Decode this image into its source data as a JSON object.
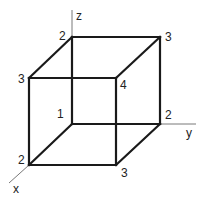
{
  "diagram": {
    "title": "",
    "type": "3D cube with vertex labels",
    "axes": {
      "x": {
        "label": "x"
      },
      "y": {
        "label": "y"
      },
      "z": {
        "label": "z"
      }
    },
    "vertices": {
      "back_bottom_left": {
        "label": "1"
      },
      "back_top_left": {
        "label": "2"
      },
      "back_top_right": {
        "label": "3"
      },
      "back_bottom_right": {
        "label": "2"
      },
      "front_top_left": {
        "label": "3"
      },
      "front_top_right": {
        "label": "4"
      },
      "front_bottom_left": {
        "label": "2"
      },
      "front_bottom_right": {
        "label": "3"
      }
    },
    "colors": {
      "edge": "#1a1a1a",
      "axis": "#555555",
      "text": "#222222",
      "background": "#ffffff"
    }
  }
}
